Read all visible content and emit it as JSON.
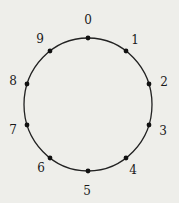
{
  "diagram": {
    "type": "circle-with-points",
    "circle": {
      "cx": 88,
      "cy": 104.5,
      "r": 64,
      "stroke": "#222222"
    },
    "point_color": "#111111",
    "nodes": [
      {
        "label": "0",
        "px": 88,
        "py": 38,
        "lx": 88,
        "ly": 20
      },
      {
        "label": "1",
        "px": 126,
        "py": 51,
        "lx": 135,
        "ly": 40
      },
      {
        "label": "2",
        "px": 149,
        "py": 84,
        "lx": 164,
        "ly": 82
      },
      {
        "label": "3",
        "px": 149,
        "py": 125,
        "lx": 163,
        "ly": 131
      },
      {
        "label": "4",
        "px": 126,
        "py": 158,
        "lx": 133,
        "ly": 170
      },
      {
        "label": "5",
        "px": 88,
        "py": 171,
        "lx": 87,
        "ly": 191
      },
      {
        "label": "6",
        "px": 50,
        "py": 158,
        "lx": 41,
        "ly": 168
      },
      {
        "label": "7",
        "px": 27,
        "py": 125,
        "lx": 13,
        "ly": 130
      },
      {
        "label": "8",
        "px": 27,
        "py": 84,
        "lx": 13,
        "ly": 81
      },
      {
        "label": "9",
        "px": 50,
        "py": 51,
        "lx": 40,
        "ly": 39
      }
    ]
  }
}
